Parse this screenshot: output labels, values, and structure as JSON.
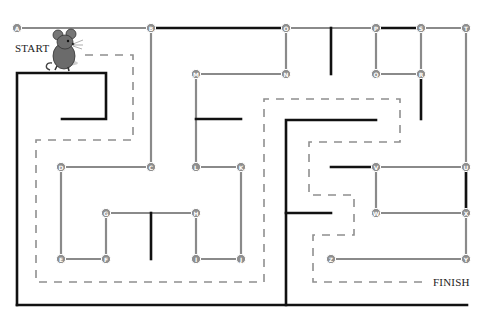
{
  "labels": {
    "start": "START",
    "finish": "FINISH"
  },
  "colors": {
    "edge": "#8a8a8a",
    "wall": "#111111",
    "path": "#8f8f8f",
    "node": "#8e8e8e"
  },
  "nodes": [
    {
      "id": "A",
      "x": 17,
      "y": 28
    },
    {
      "id": "B",
      "x": 151,
      "y": 28
    },
    {
      "id": "O",
      "x": 286,
      "y": 28
    },
    {
      "id": "P",
      "x": 376,
      "y": 28
    },
    {
      "id": "S",
      "x": 421,
      "y": 28
    },
    {
      "id": "T",
      "x": 466,
      "y": 28
    },
    {
      "id": "M",
      "x": 196,
      "y": 74
    },
    {
      "id": "N",
      "x": 286,
      "y": 74
    },
    {
      "id": "Q",
      "x": 376,
      "y": 74
    },
    {
      "id": "R",
      "x": 421,
      "y": 74
    },
    {
      "id": "D",
      "x": 61,
      "y": 167
    },
    {
      "id": "C",
      "x": 151,
      "y": 167
    },
    {
      "id": "L",
      "x": 196,
      "y": 167
    },
    {
      "id": "K",
      "x": 241,
      "y": 167
    },
    {
      "id": "V",
      "x": 376,
      "y": 167
    },
    {
      "id": "U",
      "x": 466,
      "y": 167
    },
    {
      "id": "G",
      "x": 106,
      "y": 213
    },
    {
      "id": "H",
      "x": 196,
      "y": 213
    },
    {
      "id": "W",
      "x": 376,
      "y": 213
    },
    {
      "id": "X",
      "x": 466,
      "y": 213
    },
    {
      "id": "E",
      "x": 61,
      "y": 259
    },
    {
      "id": "F",
      "x": 106,
      "y": 259
    },
    {
      "id": "I",
      "x": 196,
      "y": 259
    },
    {
      "id": "J",
      "x": 241,
      "y": 259
    },
    {
      "id": "Z",
      "x": 331,
      "y": 259
    },
    {
      "id": "Y",
      "x": 466,
      "y": 259
    }
  ],
  "edges": [
    [
      "A",
      "B"
    ],
    [
      "B",
      "O"
    ],
    [
      "O",
      "P"
    ],
    [
      "P",
      "S"
    ],
    [
      "S",
      "T"
    ],
    [
      "B",
      "C"
    ],
    [
      "O",
      "N"
    ],
    [
      "N",
      "M"
    ],
    [
      "M",
      "L"
    ],
    [
      "L",
      "K"
    ],
    [
      "K",
      "J"
    ],
    [
      "J",
      "I"
    ],
    [
      "I",
      "H"
    ],
    [
      "H",
      "G"
    ],
    [
      "G",
      "F"
    ],
    [
      "F",
      "E"
    ],
    [
      "E",
      "D"
    ],
    [
      "D",
      "C"
    ],
    [
      "P",
      "Q"
    ],
    [
      "Q",
      "R"
    ],
    [
      "R",
      "S"
    ],
    [
      "T",
      "U"
    ],
    [
      "U",
      "V"
    ],
    [
      "V",
      "W"
    ],
    [
      "W",
      "X"
    ],
    [
      "X",
      "U"
    ],
    [
      "X",
      "Y"
    ],
    [
      "Y",
      "Z"
    ]
  ],
  "walls": [
    [
      [
        17,
        305
      ],
      [
        17,
        73
      ],
      [
        106,
        73
      ],
      [
        106,
        119
      ],
      [
        62,
        119
      ]
    ],
    [
      [
        17,
        305
      ],
      [
        467,
        305
      ]
    ],
    [
      [
        151,
        28
      ],
      [
        286,
        28
      ]
    ],
    [
      [
        331,
        28
      ],
      [
        331,
        74
      ]
    ],
    [
      [
        376,
        28
      ],
      [
        421,
        28
      ]
    ],
    [
      [
        421,
        74
      ],
      [
        421,
        119
      ]
    ],
    [
      [
        196,
        119
      ],
      [
        241,
        119
      ]
    ],
    [
      [
        151,
        213
      ],
      [
        151,
        259
      ]
    ],
    [
      [
        286,
        305
      ],
      [
        286,
        120
      ],
      [
        376,
        120
      ]
    ],
    [
      [
        286,
        213
      ],
      [
        331,
        213
      ]
    ],
    [
      [
        331,
        167
      ],
      [
        376,
        167
      ]
    ],
    [
      [
        466,
        167
      ],
      [
        466,
        213
      ]
    ]
  ],
  "solution_path": [
    [
      [
        85,
        55
      ],
      [
        133,
        55
      ],
      [
        133,
        140
      ],
      [
        36,
        140
      ],
      [
        36,
        282
      ],
      [
        264,
        282
      ],
      [
        264,
        99
      ],
      [
        400,
        99
      ],
      [
        400,
        142
      ],
      [
        309,
        142
      ],
      [
        309,
        195
      ],
      [
        354,
        195
      ],
      [
        354,
        235
      ],
      [
        313,
        235
      ],
      [
        313,
        282
      ],
      [
        425,
        282
      ]
    ]
  ]
}
